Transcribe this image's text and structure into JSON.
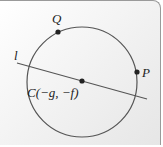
{
  "diagram": {
    "circle": {
      "cx": 82,
      "cy": 82,
      "r": 55,
      "stroke": "#555555"
    },
    "line": {
      "x1": 17,
      "y1": 63,
      "x2": 147,
      "y2": 99,
      "label": "l"
    },
    "points": [
      {
        "name": "Q",
        "x": 58,
        "y": 32,
        "label": "Q"
      },
      {
        "name": "P",
        "x": 137,
        "y": 72,
        "label": "P"
      },
      {
        "name": "C",
        "x": 82,
        "y": 81,
        "label": "C(−g, −f)"
      }
    ]
  }
}
